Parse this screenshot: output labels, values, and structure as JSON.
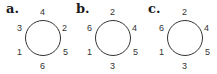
{
  "panels": [
    {
      "label": "a.",
      "top": "4",
      "upper_left": "3",
      "upper_right": "2",
      "lower_left": "1",
      "lower_right": "5",
      "bottom": "6"
    },
    {
      "label": "b.",
      "top": "2",
      "upper_left": "6",
      "upper_right": "4",
      "lower_left": "1",
      "lower_right": "5",
      "bottom": "3"
    },
    {
      "label": "c.",
      "top": "2",
      "upper_left": "6",
      "upper_right": "4",
      "lower_left": "1",
      "lower_right": "5",
      "bottom": "3"
    }
  ]
}
